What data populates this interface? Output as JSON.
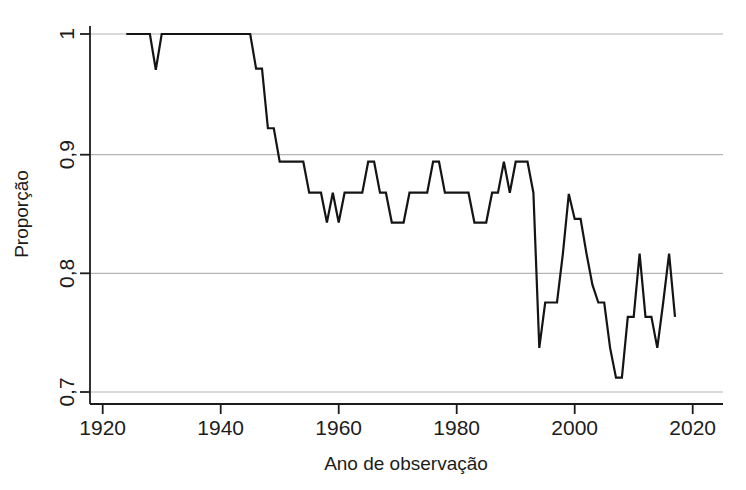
{
  "chart_data": {
    "type": "line",
    "title": "",
    "subtitle": "",
    "xlabel": "Ano de observação",
    "ylabel": "Proporção",
    "xlim": [
      1920,
      2022
    ],
    "ylim": [
      0.7,
      1.0
    ],
    "xticks": [
      1920,
      1940,
      1960,
      1980,
      2000,
      2020
    ],
    "xticklabels": [
      "1920",
      "1940",
      "1960",
      "1980",
      "2000",
      "2020"
    ],
    "yticks": [
      0.7,
      0.8,
      0.9,
      1.0
    ],
    "yticklabels": [
      "0,7",
      "0,8",
      "0,9",
      "1"
    ],
    "grid": "horizontal",
    "legend": "none",
    "line_color": "#141414",
    "grid_color": "#b4b4b4",
    "axis_color": "#1c1c1c",
    "series": [
      {
        "name": "Proporção",
        "x": [
          1924,
          1925,
          1926,
          1927,
          1928,
          1929,
          1930,
          1931,
          1932,
          1933,
          1934,
          1935,
          1936,
          1937,
          1938,
          1939,
          1940,
          1941,
          1942,
          1943,
          1944,
          1945,
          1946,
          1947,
          1948,
          1949,
          1950,
          1951,
          1952,
          1953,
          1954,
          1955,
          1956,
          1957,
          1958,
          1959,
          1960,
          1961,
          1962,
          1963,
          1964,
          1965,
          1966,
          1967,
          1968,
          1969,
          1970,
          1971,
          1972,
          1973,
          1974,
          1975,
          1976,
          1977,
          1978,
          1979,
          1980,
          1981,
          1982,
          1983,
          1984,
          1985,
          1986,
          1987,
          1988,
          1989,
          1990,
          1991,
          1992,
          1993,
          1994,
          1995,
          1996,
          1997,
          1998,
          1999,
          2000,
          2001,
          2002,
          2003,
          2004,
          2005,
          2006,
          2007,
          2008,
          2009,
          2010,
          2011,
          2012,
          2013,
          2014,
          2015,
          2016,
          2017
        ],
        "y": [
          1.0,
          1.0,
          1.0,
          1.0,
          1.0,
          0.97,
          1.0,
          1.0,
          1.0,
          1.0,
          1.0,
          1.0,
          1.0,
          1.0,
          1.0,
          1.0,
          1.0,
          1.0,
          1.0,
          1.0,
          1.0,
          1.0,
          0.971,
          0.971,
          0.921,
          0.921,
          0.893,
          0.893,
          0.893,
          0.893,
          0.893,
          0.867,
          0.867,
          0.867,
          0.842,
          0.867,
          0.842,
          0.867,
          0.867,
          0.867,
          0.867,
          0.893,
          0.893,
          0.867,
          0.867,
          0.842,
          0.842,
          0.842,
          0.867,
          0.867,
          0.867,
          0.867,
          0.893,
          0.893,
          0.867,
          0.867,
          0.867,
          0.867,
          0.867,
          0.842,
          0.842,
          0.842,
          0.867,
          0.867,
          0.893,
          0.867,
          0.893,
          0.893,
          0.893,
          0.867,
          0.737,
          0.775,
          0.775,
          0.775,
          0.816,
          0.866,
          0.845,
          0.845,
          0.816,
          0.79,
          0.775,
          0.775,
          0.737,
          0.712,
          0.712,
          0.763,
          0.763,
          0.816,
          0.763,
          0.763,
          0.737,
          0.775,
          0.816,
          0.763
        ]
      }
    ]
  },
  "axes": {
    "y_tick_1": "1",
    "y_tick_09": "0,9",
    "y_tick_08": "0,8",
    "y_tick_07": "0,7",
    "x_tick_1920": "1920",
    "x_tick_1940": "1940",
    "x_tick_1960": "1960",
    "x_tick_1980": "1980",
    "x_tick_2000": "2000",
    "x_tick_2020": "2020",
    "x_title": "Ano de observação",
    "y_title": "Proporção"
  }
}
